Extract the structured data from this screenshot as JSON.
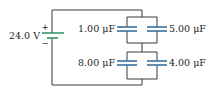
{
  "battery": {
    "voltage_label": "24.0 V",
    "plus_sign": "+",
    "minus_sign": "−"
  },
  "capacitors": {
    "upper_left": {
      "label": "1.00 μF"
    },
    "upper_right": {
      "label": "5.00 μF"
    },
    "lower_left": {
      "label": "8.00 μF"
    },
    "lower_right": {
      "label": "4.00 μF"
    }
  },
  "colors": {
    "wire": "#3a3a3a",
    "capacitor_plate": "#3b6f9e",
    "battery_plate": "#2e9a6a",
    "text": "#231f20"
  }
}
